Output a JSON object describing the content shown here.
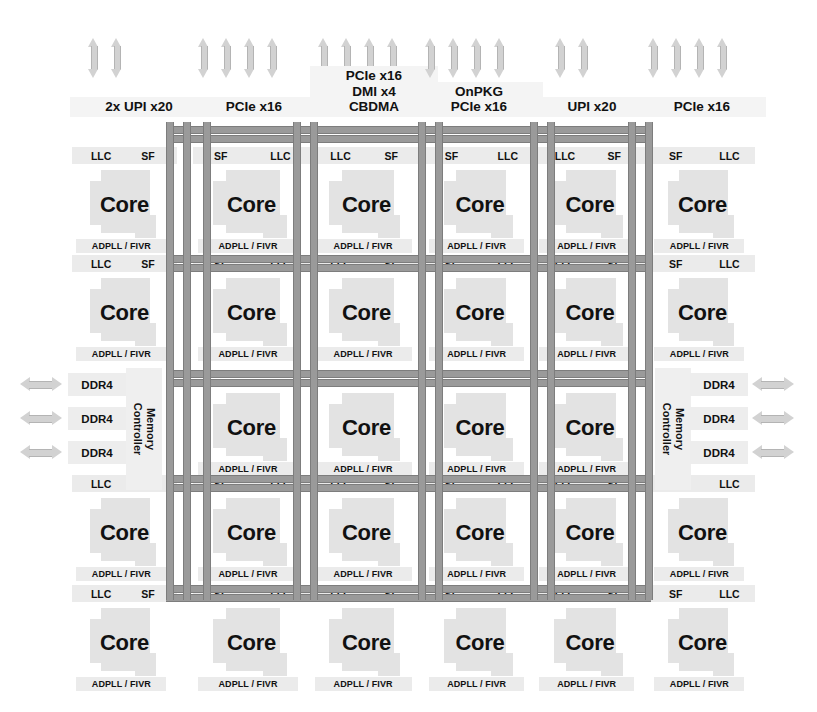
{
  "diagram": {
    "colors": {
      "background": "#ffffff",
      "tile_fill": "#e3e3e3",
      "cap_fill": "#ebebeb",
      "mesh_wire": "#9a9a9a",
      "mesh_wire_edge": "#7d7d7d",
      "arrow_fill": "#d2d2d2",
      "text": "#111111"
    }
  },
  "top_io": [
    {
      "label": "2x UPI x20",
      "arrows": 2,
      "x": 88,
      "label_x": 70,
      "label_w": 130
    },
    {
      "label": "PCIe x16",
      "arrows": 4,
      "x": 198,
      "label_x": 190,
      "label_w": 120
    },
    {
      "label": "PCIe x16\nDMI x4\nCBDMA",
      "arrows": 4,
      "x": 318,
      "label_x": 310,
      "label_w": 120
    },
    {
      "label": "OnPKG\nPCIe x16",
      "arrows": 4,
      "x": 425,
      "label_x": 415,
      "label_w": 120
    },
    {
      "label": "UPI x20",
      "arrows": 2,
      "x": 555,
      "label_x": 528,
      "label_w": 120
    },
    {
      "label": "PCIe x16",
      "arrows": 4,
      "x": 648,
      "label_x": 638,
      "label_w": 120
    }
  ],
  "cache_labels": {
    "llc": "LLC",
    "sf": "SF"
  },
  "core_label": "Core",
  "fivr_label": "ADPLL / FIVR",
  "memory": {
    "controller_label": "Memory\nController",
    "ddr_label": "DDR4",
    "left_channels": [
      "DDR4",
      "DDR4",
      "DDR4"
    ],
    "right_channels": [
      "DDR4",
      "DDR4",
      "DDR4"
    ]
  },
  "grid": {
    "columns": [
      {
        "index": 0,
        "x": 72,
        "w": 105,
        "cap_order": "llc-sf"
      },
      {
        "index": 1,
        "x": 193,
        "w": 117,
        "cap_order": "sf-llc"
      },
      {
        "index": 2,
        "x": 310,
        "w": 113,
        "cap_order": "llc-sf"
      },
      {
        "index": 3,
        "x": 425,
        "w": 110,
        "cap_order": "sf-llc"
      },
      {
        "index": 4,
        "x": 535,
        "w": 110,
        "cap_order": "llc-sf"
      },
      {
        "index": 5,
        "x": 650,
        "w": 105,
        "cap_order": "sf-llc"
      }
    ],
    "rows": [
      {
        "index": 0,
        "y": 22,
        "h": 105,
        "cap_above": true,
        "columns": [
          0,
          1,
          2,
          3,
          4,
          5
        ]
      },
      {
        "index": 1,
        "y": 130,
        "h": 105,
        "cap_above": true,
        "columns": [
          0,
          1,
          2,
          3,
          4,
          5
        ]
      },
      {
        "index": 2,
        "y": 245,
        "h": 105,
        "cap_above": false,
        "columns": [
          1,
          2,
          3,
          4
        ]
      },
      {
        "index": 3,
        "y": 350,
        "h": 105,
        "cap_above": true,
        "columns": [
          0,
          1,
          2,
          3,
          4,
          5
        ]
      },
      {
        "index": 4,
        "y": 460,
        "h": 105,
        "cap_above": true,
        "columns": [
          0,
          1,
          2,
          3,
          4,
          5
        ]
      }
    ],
    "core_count": 26
  },
  "mesh": {
    "vertical_x": [
      166,
      183,
      203,
      293,
      310,
      418,
      435,
      530,
      547,
      628,
      645
    ],
    "horizontal_y": [
      -4,
      125,
      240,
      345,
      455,
      588
    ],
    "v_top": -8,
    "v_bottom": 470,
    "h_left": 166,
    "h_right": 651
  }
}
